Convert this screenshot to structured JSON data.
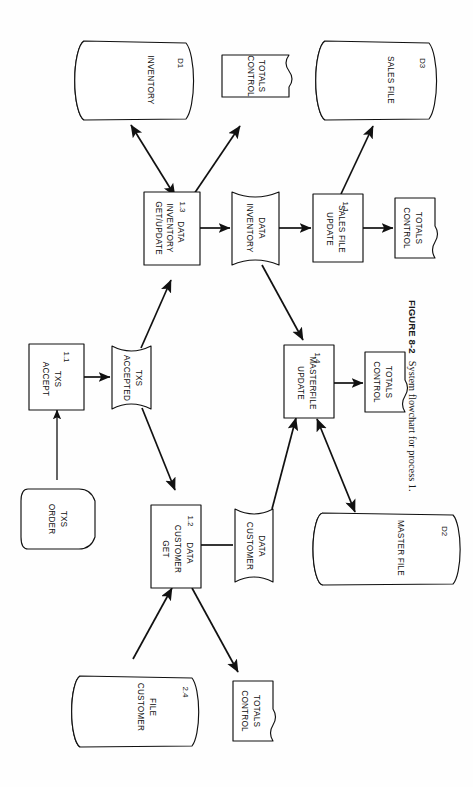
{
  "figure": {
    "number_label": "FIGURE 8-2",
    "caption": "System flowchart for process 1.",
    "orientation": "rotated-90-clockwise",
    "diagram_type": "system-flowchart"
  },
  "nodes": {
    "inventory_store": {
      "label": "INVENTORY",
      "id": "D1",
      "shape": "cylinder"
    },
    "control_totals_inventory": {
      "label_line1": "CONTROL",
      "label_line2": "TOTALS",
      "shape": "document"
    },
    "sales_file_store": {
      "label": "SALES FILE",
      "id": "D3",
      "shape": "cylinder"
    },
    "get_update_inventory": {
      "label_line1": "GET/UPDATE",
      "label_line2": "INVENTORY",
      "label_line3": "DATA",
      "id": "1.3",
      "shape": "process"
    },
    "inventory_data_flow": {
      "label_line1": "INVENTORY",
      "label_line2": "DATA",
      "shape": "data-flow"
    },
    "update_sales_file": {
      "label_line1": "UPDATE",
      "label_line2": "SALES FILE",
      "id": "1.1",
      "shape": "process"
    },
    "control_totals_sales": {
      "label_line1": "CONTROL",
      "label_line2": "TOTALS",
      "shape": "document"
    },
    "accept_txs": {
      "label_line1": "ACCEPT",
      "label_line2": "TXS",
      "id": "1.1",
      "shape": "process"
    },
    "accepted_txs": {
      "label_line1": "ACCEPTED",
      "label_line2": "TXS",
      "shape": "data-flow"
    },
    "order_txs": {
      "label_line1": "ORDER",
      "label_line2": "TXS",
      "shape": "manual-input"
    },
    "update_masterfile": {
      "label_line1": "UPDATE",
      "label_line2": "MASTERFILE",
      "id": "1.4",
      "shape": "process"
    },
    "control_totals_master": {
      "label_line1": "CONTROL",
      "label_line2": "TOTALS",
      "shape": "document"
    },
    "get_customer_data": {
      "label_line1": "GET",
      "label_line2": "CUSTOMER",
      "label_line3": "DATA",
      "id": "1.2",
      "shape": "process"
    },
    "customer_data_flow": {
      "label_line1": "CUSTOMER",
      "label_line2": "DATA",
      "shape": "data-flow"
    },
    "master_file_store": {
      "label": "MASTER FILE",
      "id": "D2",
      "shape": "cylinder"
    },
    "customer_file_store": {
      "label_line1": "CUSTOMER",
      "label_line2": "FILE",
      "id": "2.4",
      "shape": "cylinder"
    },
    "control_totals_customer": {
      "label_line1": "CONTROL",
      "label_line2": "TOTALS",
      "shape": "document"
    }
  },
  "edges": [
    {
      "from": "get_update_inventory",
      "to": "inventory_store",
      "arrow": "double"
    },
    {
      "from": "get_update_inventory",
      "to": "control_totals_inventory",
      "arrow": "single"
    },
    {
      "from": "get_update_inventory",
      "to": "inventory_data_flow",
      "arrow": "single"
    },
    {
      "from": "inventory_data_flow",
      "to": "update_sales_file",
      "arrow": "single"
    },
    {
      "from": "update_sales_file",
      "to": "sales_file_store",
      "arrow": "single"
    },
    {
      "from": "update_sales_file",
      "to": "control_totals_sales",
      "arrow": "single"
    },
    {
      "from": "inventory_data_flow",
      "to": "update_masterfile",
      "arrow": "single"
    },
    {
      "from": "order_txs",
      "to": "accept_txs",
      "arrow": "single"
    },
    {
      "from": "accept_txs",
      "to": "accepted_txs",
      "arrow": "single"
    },
    {
      "from": "accepted_txs",
      "to": "get_update_inventory",
      "arrow": "single"
    },
    {
      "from": "accepted_txs",
      "to": "get_customer_data",
      "arrow": "single"
    },
    {
      "from": "get_customer_data",
      "to": "customer_data_flow",
      "arrow": "none"
    },
    {
      "from": "customer_data_flow",
      "to": "update_masterfile",
      "arrow": "single"
    },
    {
      "from": "master_file_store",
      "to": "update_masterfile",
      "arrow": "double"
    },
    {
      "from": "update_masterfile",
      "to": "control_totals_master",
      "arrow": "single"
    },
    {
      "from": "customer_file_store",
      "to": "get_customer_data",
      "arrow": "single"
    },
    {
      "from": "get_customer_data",
      "to": "control_totals_customer",
      "arrow": "single"
    }
  ],
  "colors": {
    "ink": "#111111",
    "paper": "#fefefe"
  }
}
